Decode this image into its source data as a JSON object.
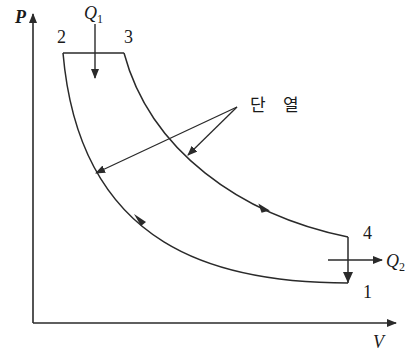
{
  "diagram": {
    "type": "P-V diagram (Diesel cycle)",
    "axes": {
      "y_label": "P",
      "x_label": "V"
    },
    "points": [
      {
        "id": "1",
        "label": "1"
      },
      {
        "id": "2",
        "label": "2"
      },
      {
        "id": "3",
        "label": "3"
      },
      {
        "id": "4",
        "label": "4"
      }
    ],
    "heat": {
      "in": {
        "symbol": "Q",
        "subscript": "1"
      },
      "out": {
        "symbol": "Q",
        "subscript": "2"
      }
    },
    "annotation": "단 열",
    "colors": {
      "line": "#2a2a2a",
      "background": "#ffffff"
    }
  }
}
